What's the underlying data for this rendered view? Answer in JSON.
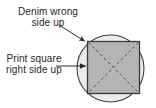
{
  "figure": {
    "background_color": "#ffffff",
    "labels": {
      "denim": {
        "line1": "Denim wrong",
        "line2": "side up",
        "color": "#262626"
      },
      "print": {
        "line1": "Print square",
        "line2": "right side up",
        "color": "#262626"
      }
    },
    "shapes": {
      "circle": {
        "name": "denim-circle",
        "cx": 110.5,
        "cy": 68.5,
        "r": 33.5,
        "fill": "#ebebeb",
        "stroke": "#3f3f3f",
        "stroke_width": 1.1
      },
      "square": {
        "name": "print-square",
        "x": 87.5,
        "y": 41.5,
        "width": 52,
        "height": 52,
        "fill": "#b4b4b4",
        "stroke": "#3a3a3a",
        "stroke_width": 1.3
      },
      "diagonals": {
        "name": "square-diagonals",
        "stroke": "#4a4a4a",
        "stroke_width": 0.9,
        "dash": "3 2.5"
      }
    },
    "annotations": [
      {
        "name": "denim-leader-arrow",
        "from_x": 59,
        "from_y": 25,
        "to_x": 86,
        "to_y": 42,
        "stroke": "#2b2b2b",
        "points_to": "circle-edge-top-left"
      },
      {
        "name": "print-leader-arrow",
        "from_x": 56,
        "from_y": 66,
        "to_x": 87,
        "to_y": 66,
        "stroke": "#2b2b2b",
        "points_to": "square-left-edge"
      }
    ]
  }
}
